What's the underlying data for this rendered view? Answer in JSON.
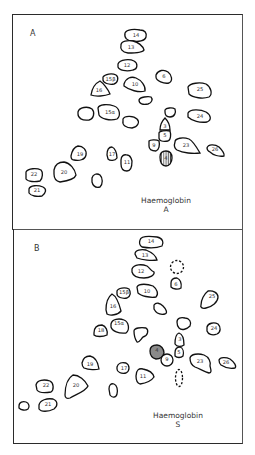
{
  "figure": {
    "type": "peptide fingerprint map comparison",
    "panels": [
      {
        "id": "A",
        "label": "A",
        "caption_line1": "Haemoglobin",
        "caption_line2": "A",
        "spots": [
          {
            "label": "14",
            "cx": 139,
            "cy": 36
          },
          {
            "label": "13",
            "cx": 132,
            "cy": 48
          },
          {
            "label": "12",
            "cx": 127,
            "cy": 66
          },
          {
            "label": "15β",
            "cx": 112,
            "cy": 80
          },
          {
            "label": "16",
            "cx": 100,
            "cy": 89
          },
          {
            "label": "10",
            "cx": 136,
            "cy": 84
          },
          {
            "label": "6",
            "cx": 164,
            "cy": 77
          },
          {
            "label": "25",
            "cx": 200,
            "cy": 90
          },
          {
            "label": "",
            "cx": 146,
            "cy": 100
          },
          {
            "label": "18",
            "cx": 86,
            "cy": 114
          },
          {
            "label": "15α",
            "cx": 111,
            "cy": 112
          },
          {
            "label": "",
            "cx": 131,
            "cy": 122
          },
          {
            "label": "",
            "cx": 170,
            "cy": 113
          },
          {
            "label": "24",
            "cx": 200,
            "cy": 116
          },
          {
            "label": "3",
            "cx": 165,
            "cy": 125
          },
          {
            "label": "5",
            "cx": 165,
            "cy": 136
          },
          {
            "label": "9",
            "cx": 154,
            "cy": 146
          },
          {
            "label": "23",
            "cx": 186,
            "cy": 145
          },
          {
            "label": "26",
            "cx": 215,
            "cy": 150
          },
          {
            "label": "4",
            "cx": 166,
            "cy": 158,
            "style": "hatched"
          },
          {
            "label": "19",
            "cx": 80,
            "cy": 154
          },
          {
            "label": "17",
            "cx": 111,
            "cy": 155
          },
          {
            "label": "11",
            "cx": 127,
            "cy": 162
          },
          {
            "label": "20",
            "cx": 65,
            "cy": 173
          },
          {
            "label": "22",
            "cx": 35,
            "cy": 174
          },
          {
            "label": "",
            "cx": 97,
            "cy": 180
          },
          {
            "label": "21",
            "cx": 38,
            "cy": 190
          }
        ]
      },
      {
        "id": "B",
        "label": "B",
        "caption_line1": "Haemoglobin",
        "caption_line2": "S",
        "spots": [
          {
            "label": "14",
            "cx": 151,
            "cy": 242
          },
          {
            "label": "13",
            "cx": 146,
            "cy": 256
          },
          {
            "label": "",
            "cx": 176,
            "cy": 267,
            "style": "dashed"
          },
          {
            "label": "12",
            "cx": 143,
            "cy": 272
          },
          {
            "label": "6",
            "cx": 176,
            "cy": 284
          },
          {
            "label": "15β",
            "cx": 124,
            "cy": 293
          },
          {
            "label": "10",
            "cx": 147,
            "cy": 291
          },
          {
            "label": "25",
            "cx": 210,
            "cy": 298
          },
          {
            "label": "16",
            "cx": 113,
            "cy": 306
          },
          {
            "label": "",
            "cx": 159,
            "cy": 307
          },
          {
            "label": "",
            "cx": 184,
            "cy": 324
          },
          {
            "label": "18",
            "cx": 101,
            "cy": 330
          },
          {
            "label": "15α",
            "cx": 119,
            "cy": 327
          },
          {
            "label": "",
            "cx": 141,
            "cy": 334
          },
          {
            "label": "24",
            "cx": 213,
            "cy": 329
          },
          {
            "label": "3",
            "cx": 179,
            "cy": 340
          },
          {
            "label": "4",
            "cx": 157,
            "cy": 351,
            "style": "shaded"
          },
          {
            "label": "5",
            "cx": 179,
            "cy": 353
          },
          {
            "label": "9",
            "cx": 167,
            "cy": 360
          },
          {
            "label": "23",
            "cx": 201,
            "cy": 362
          },
          {
            "label": "26",
            "cx": 227,
            "cy": 363
          },
          {
            "label": "19",
            "cx": 90,
            "cy": 366
          },
          {
            "label": "17",
            "cx": 124,
            "cy": 369
          },
          {
            "label": "11",
            "cx": 144,
            "cy": 377
          },
          {
            "label": "",
            "cx": 179,
            "cy": 378,
            "style": "dashed"
          },
          {
            "label": "22",
            "cx": 46,
            "cy": 386
          },
          {
            "label": "20",
            "cx": 76,
            "cy": 385
          },
          {
            "label": "",
            "cx": 113,
            "cy": 391
          },
          {
            "label": "21",
            "cx": 49,
            "cy": 405
          },
          {
            "label": "",
            "cx": 24,
            "cy": 406
          }
        ]
      }
    ]
  }
}
